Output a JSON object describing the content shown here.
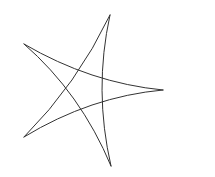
{
  "figure": {
    "width": 215,
    "height": 177,
    "background": "#ffffff",
    "stroke_color": "#333333",
    "shape": "curved five-pointed star (pentagram with concave arcs)",
    "points": [
      {
        "name": "top",
        "x": 110,
        "y": 15
      },
      {
        "name": "upper-left",
        "x": 24,
        "y": 44
      },
      {
        "name": "right",
        "x": 163,
        "y": 90
      },
      {
        "name": "lower-left",
        "x": 24,
        "y": 137
      },
      {
        "name": "bottom",
        "x": 111,
        "y": 166
      }
    ],
    "edges": [
      {
        "from": "top",
        "to": "lower-left",
        "cx": 77,
        "cy": 84
      },
      {
        "from": "top",
        "to": "bottom",
        "cx": 93.5,
        "cy": 90
      },
      {
        "from": "upper-left",
        "to": "right",
        "cx": 90.5,
        "cy": 83
      },
      {
        "from": "upper-left",
        "to": "bottom",
        "cx": 80.5,
        "cy": 93
      },
      {
        "from": "lower-left",
        "to": "right",
        "cx": 90.5,
        "cy": 96.5
      }
    ]
  }
}
